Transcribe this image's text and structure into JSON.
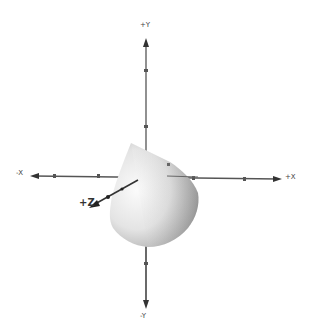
{
  "scene": {
    "background": "#ffffff",
    "axis_color": "#555555",
    "shape": "cone",
    "shape_color_light": "#f2f2f2",
    "shape_color_dark": "#8a8a8a"
  },
  "axes": {
    "pos_y": "+Y",
    "neg_y": "-Y",
    "pos_x": "+X",
    "neg_x": "-X",
    "pos_z": "+Z"
  }
}
